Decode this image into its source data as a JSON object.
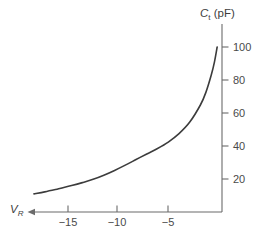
{
  "figure": {
    "background_color": "#ffffff",
    "axis_color": "#6b6b6b",
    "curve_color": "#3c3c3c",
    "text_color": "#4a4a4a"
  },
  "axes": {
    "y_title_symbol": "C",
    "y_title_subscript": "t",
    "y_title_units": "(pF)",
    "x_title_symbol": "V",
    "x_title_subscript": "R",
    "x_arrow_direction": "left"
  },
  "ticks": {
    "x_labels": [
      "−15",
      "−10",
      "−5"
    ],
    "y_labels": [
      "20",
      "40",
      "60",
      "80",
      "100"
    ]
  },
  "chart_data": {
    "type": "line",
    "title": "",
    "subtitle": "",
    "xlabel": "V_R",
    "ylabel": "C_t (pF)",
    "xlim": [
      -17.5,
      0
    ],
    "ylim": [
      0,
      110
    ],
    "xticks": [
      -15,
      -10,
      -5
    ],
    "yticks": [
      20,
      40,
      60,
      80,
      100
    ],
    "xtick_labels": [
      "−15",
      "−10",
      "−5"
    ],
    "ytick_labels": [
      "20",
      "40",
      "60",
      "80",
      "100"
    ],
    "grid": false,
    "legend": null,
    "series": [
      {
        "name": "Total capacitance vs reverse voltage",
        "x": [
          -17.5,
          -16.5,
          -15.5,
          -15.0,
          -14.0,
          -13.0,
          -12.0,
          -11.0,
          -10.0,
          -9.0,
          -8.0,
          -7.0,
          -6.0,
          -5.0,
          -4.0,
          -3.0,
          -2.0,
          -1.5,
          -1.0,
          -0.7,
          -0.45
        ],
        "y": [
          11.0,
          12.2,
          13.6,
          14.4,
          16.0,
          17.8,
          19.8,
          22.3,
          25.2,
          28.4,
          31.8,
          35.2,
          38.5,
          42.4,
          47.5,
          54.5,
          65.0,
          72.5,
          83.0,
          91.0,
          100.0
        ]
      }
    ]
  }
}
